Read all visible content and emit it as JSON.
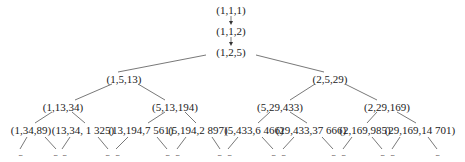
{
  "diagram": {
    "type": "tree",
    "nodes": [
      {
        "id": "n0",
        "label": "(1,1,1)",
        "x": 231,
        "y": 4
      },
      {
        "id": "n1",
        "label": "(1,1,2)",
        "x": 231,
        "y": 25
      },
      {
        "id": "n2",
        "label": "(1,2,5)",
        "x": 231,
        "y": 46
      },
      {
        "id": "n3",
        "label": "(1,5,13)",
        "x": 124,
        "y": 73
      },
      {
        "id": "n4",
        "label": "(2,5,29)",
        "x": 330,
        "y": 73
      },
      {
        "id": "n5",
        "label": "(1,13,34)",
        "x": 63,
        "y": 101
      },
      {
        "id": "n6",
        "label": "(5,13,194)",
        "x": 175,
        "y": 101
      },
      {
        "id": "n7",
        "label": "(5,29,433)",
        "x": 280,
        "y": 101
      },
      {
        "id": "n8",
        "label": "(2,29,169)",
        "x": 387,
        "y": 101
      },
      {
        "id": "n9",
        "label": "(1,34,89)",
        "x": 31,
        "y": 124
      },
      {
        "id": "n10",
        "label": "(13,34, 1 325)",
        "x": 83,
        "y": 124
      },
      {
        "id": "n11",
        "label": "(13,194,7  561)",
        "x": 141,
        "y": 124
      },
      {
        "id": "n12",
        "label": "(5,194,2 897)",
        "x": 198,
        "y": 124
      },
      {
        "id": "n13",
        "label": "(5,433,6 466)",
        "x": 254,
        "y": 124
      },
      {
        "id": "n14",
        "label": "(29,433,37 666)",
        "x": 311,
        "y": 124
      },
      {
        "id": "n15",
        "label": "(2,169,985)",
        "x": 365,
        "y": 124
      },
      {
        "id": "n16",
        "label": "(29,169,14 701)",
        "x": 420,
        "y": 124
      }
    ],
    "arrows": [
      {
        "from": "n0",
        "to": "n1"
      },
      {
        "from": "n1",
        "to": "n2"
      }
    ],
    "edges": [
      {
        "from": "n2",
        "to": "n3"
      },
      {
        "from": "n2",
        "to": "n4"
      },
      {
        "from": "n3",
        "to": "n5"
      },
      {
        "from": "n3",
        "to": "n6"
      },
      {
        "from": "n4",
        "to": "n7"
      },
      {
        "from": "n4",
        "to": "n8"
      },
      {
        "from": "n5",
        "to": "n9"
      },
      {
        "from": "n5",
        "to": "n10"
      },
      {
        "from": "n6",
        "to": "n11"
      },
      {
        "from": "n6",
        "to": "n12"
      },
      {
        "from": "n7",
        "to": "n13"
      },
      {
        "from": "n7",
        "to": "n14"
      },
      {
        "from": "n8",
        "to": "n15"
      },
      {
        "from": "n8",
        "to": "n16"
      }
    ],
    "ellipsis": {
      "label": "...",
      "positions": [
        20,
        55,
        63,
        108,
        116,
        167,
        177,
        220,
        228,
        273,
        283,
        333,
        343,
        382,
        392,
        437
      ]
    }
  }
}
